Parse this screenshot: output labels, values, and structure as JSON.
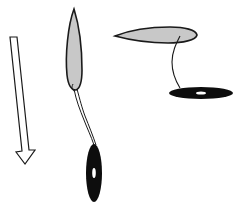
{
  "diagram": {
    "colors": {
      "background": "#ffffff",
      "outline": "#1a1a1a",
      "body_fill": "#c8c8c8",
      "disc_fill": "#0d0d0d",
      "disc_center": "#ffffff",
      "arrow_fill": "#ffffff"
    },
    "arrow": {
      "direction": "down",
      "style": "hollow"
    },
    "left_configuration": {
      "body_orientation": "vertical",
      "disc_orientation": "vertical"
    },
    "right_configuration": {
      "body_orientation": "horizontal",
      "disc_orientation": "horizontal"
    }
  }
}
